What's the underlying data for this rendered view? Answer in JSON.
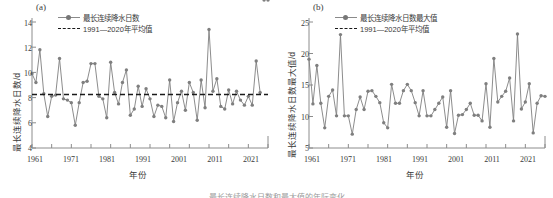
{
  "figure": {
    "caption_partial": "最长连续降水日数和最大值的年际变化"
  },
  "panels": [
    {
      "key": "a",
      "label": "(a)",
      "xlabel": "年份",
      "ylabel": "最长连续降水日数/d",
      "yticks": [
        "4",
        "6",
        "8",
        "10",
        "12",
        "14"
      ],
      "xticks": [
        "1961",
        "1971",
        "1981",
        "1991",
        "2001",
        "2011",
        "2021"
      ],
      "legend": [
        {
          "name": "series-line",
          "text": "最长连续降水日数",
          "style": "line-marker",
          "color": "#7f7f7f"
        },
        {
          "name": "mean-line",
          "text": "1991—2020年平均值",
          "style": "dashed",
          "color": "#1a1a1a"
        }
      ]
    },
    {
      "key": "b",
      "label": "(b)",
      "xlabel": "年份",
      "ylabel": "最长连续降水日数最大值/d",
      "yticks": [
        "5",
        "10",
        "15",
        "20",
        "25"
      ],
      "xticks": [
        "1961",
        "1971",
        "1981",
        "1991",
        "2001",
        "2011",
        "2021"
      ],
      "legend": [
        {
          "name": "series-line",
          "text": "最长连续降水日数最大值",
          "style": "line-marker",
          "color": "#7f7f7f"
        },
        {
          "name": "mean-line",
          "text": "1991—2020年平均值",
          "style": "dashed",
          "color": "#1a1a1a"
        }
      ]
    }
  ],
  "chart_data": [
    {
      "type": "line",
      "panel": "a",
      "title": "(a)",
      "xlabel": "年份",
      "ylabel": "最长连续降水日数/d",
      "xlim": [
        1961,
        2021
      ],
      "ylim": [
        4,
        14
      ],
      "yticks": [
        4,
        6,
        8,
        10,
        12,
        14
      ],
      "xticks": [
        1961,
        1971,
        1981,
        1991,
        2001,
        2011,
        2021
      ],
      "grid": false,
      "legend_position": "top-center",
      "series": [
        {
          "name": "最长连续降水日数",
          "marker": "circle",
          "color": "#7f7f7f",
          "x": [
            1961,
            1962,
            1963,
            1964,
            1965,
            1966,
            1967,
            1968,
            1969,
            1970,
            1971,
            1972,
            1973,
            1974,
            1975,
            1976,
            1977,
            1978,
            1979,
            1980,
            1981,
            1982,
            1983,
            1984,
            1985,
            1986,
            1987,
            1988,
            1989,
            1990,
            1991,
            1992,
            1993,
            1994,
            1995,
            1996,
            1997,
            1998,
            1999,
            2000,
            2001,
            2002,
            2003,
            2004,
            2005,
            2006,
            2007,
            2008,
            2009,
            2010,
            2011,
            2012,
            2013,
            2014,
            2015,
            2016,
            2017,
            2018,
            2019,
            2020,
            2021
          ],
          "y": [
            9.9,
            9.2,
            11.8,
            8.3,
            6.5,
            8.1,
            8.2,
            11.1,
            7.9,
            7.8,
            7.6,
            5.8,
            7.6,
            9.2,
            9.3,
            10.7,
            10.7,
            8.1,
            7.9,
            6.4,
            10.8,
            8.4,
            7.5,
            9.2,
            10.2,
            6.6,
            7.1,
            8.9,
            7.3,
            8.7,
            7.9,
            6.5,
            7.4,
            7.3,
            6.4,
            9.4,
            6.1,
            7.6,
            8.5,
            7.0,
            9.2,
            8.4,
            6.2,
            9.4,
            7.2,
            13.4,
            8.5,
            9.5,
            7.3,
            7.1,
            8.6,
            7.5,
            8.5,
            7.8,
            7.4,
            8.1,
            7.4,
            10.9,
            8.4
          ]
        },
        {
          "name": "1991—2020年平均值",
          "type": "hline",
          "style": "dashed",
          "color": "#1a1a1a",
          "value": 8.25
        }
      ]
    },
    {
      "type": "line",
      "panel": "b",
      "title": "(b)",
      "xlabel": "年份",
      "ylabel": "最长连续降水日数最大值/d",
      "xlim": [
        1961,
        2021
      ],
      "ylim": [
        5,
        25
      ],
      "yticks": [
        5,
        10,
        15,
        20,
        25
      ],
      "xticks": [
        1961,
        1971,
        1981,
        1991,
        2001,
        2011,
        2021
      ],
      "grid": false,
      "legend_position": "top-center",
      "series": [
        {
          "name": "最长连续降水日数最大值",
          "marker": "circle",
          "color": "#7f7f7f",
          "x": [
            1961,
            1962,
            1963,
            1964,
            1965,
            1966,
            1967,
            1968,
            1969,
            1970,
            1971,
            1972,
            1973,
            1974,
            1975,
            1976,
            1977,
            1978,
            1979,
            1980,
            1981,
            1982,
            1983,
            1984,
            1985,
            1986,
            1987,
            1988,
            1989,
            1990,
            1991,
            1992,
            1993,
            1994,
            1995,
            1996,
            1997,
            1998,
            1999,
            2000,
            2001,
            2002,
            2003,
            2004,
            2005,
            2006,
            2007,
            2008,
            2009,
            2010,
            2011,
            2012,
            2013,
            2014,
            2015,
            2016,
            2017,
            2018,
            2019,
            2020,
            2021
          ],
          "y": [
            19.1,
            12.0,
            18.1,
            12.1,
            8.2,
            13.2,
            14.2,
            10.1,
            23.0,
            10.1,
            10.1,
            7.2,
            11.1,
            13.1,
            11.1,
            14.0,
            14.1,
            13.2,
            12.2,
            9.0,
            8.2,
            15.1,
            12.1,
            12.1,
            14.1,
            15.1,
            14.1,
            12.2,
            10.1,
            14.1,
            10.1,
            10.1,
            11.1,
            12.1,
            13.1,
            8.3,
            14.1,
            7.3,
            10.2,
            10.3,
            11.1,
            12.1,
            10.2,
            10.2,
            9.3,
            15.2,
            8.3,
            19.2,
            12.3,
            13.2,
            14.0,
            16.1,
            9.3,
            23.1,
            11.2,
            12.3,
            15.2,
            7.4,
            12.1,
            13.3,
            13.2
          ]
        },
        {
          "name": "1991—2020年平均值",
          "type": "hline",
          "style": "dashed",
          "color": "#1a1a1a",
          "value": null
        }
      ]
    }
  ]
}
